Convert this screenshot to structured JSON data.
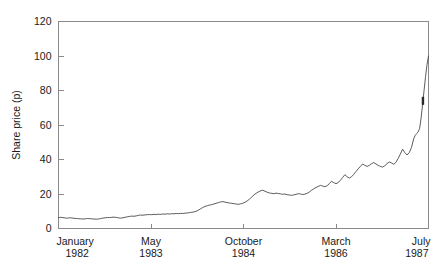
{
  "chart_data": {
    "type": "line",
    "title": "",
    "xlabel": "",
    "ylabel": "Share price (p)",
    "ylim": [
      0,
      120
    ],
    "yticks": [
      0,
      20,
      40,
      60,
      80,
      100,
      120
    ],
    "ytick_labels": [
      "0",
      "20",
      "40",
      "60",
      "80",
      "100",
      "120"
    ],
    "grid": false,
    "legend": false,
    "xtick_labels": [
      {
        "month": "January",
        "year": "1982"
      },
      {
        "month": "May",
        "year": "1983"
      },
      {
        "month": "October",
        "year": "1984"
      },
      {
        "month": "March",
        "year": "1986"
      },
      {
        "month": "July",
        "year": "1987"
      }
    ],
    "xtick_positions": [
      0.0,
      0.25,
      0.5,
      0.75,
      1.0
    ],
    "series": [
      {
        "name": "Share price",
        "x": [
          0.0,
          0.006,
          0.012,
          0.018,
          0.024,
          0.03,
          0.036,
          0.042,
          0.048,
          0.054,
          0.06,
          0.066,
          0.072,
          0.078,
          0.084,
          0.09,
          0.096,
          0.102,
          0.108,
          0.114,
          0.12,
          0.126,
          0.132,
          0.138,
          0.144,
          0.15,
          0.156,
          0.162,
          0.168,
          0.174,
          0.18,
          0.186,
          0.192,
          0.198,
          0.204,
          0.21,
          0.216,
          0.222,
          0.228,
          0.234,
          0.24,
          0.246,
          0.252,
          0.258,
          0.264,
          0.27,
          0.276,
          0.282,
          0.288,
          0.294,
          0.3,
          0.306,
          0.312,
          0.318,
          0.324,
          0.33,
          0.336,
          0.342,
          0.348,
          0.354,
          0.36,
          0.366,
          0.372,
          0.378,
          0.384,
          0.39,
          0.396,
          0.402,
          0.408,
          0.414,
          0.42,
          0.426,
          0.432,
          0.438,
          0.444,
          0.45,
          0.456,
          0.462,
          0.468,
          0.474,
          0.48,
          0.486,
          0.492,
          0.498,
          0.504,
          0.51,
          0.516,
          0.522,
          0.528,
          0.534,
          0.54,
          0.546,
          0.552,
          0.558,
          0.564,
          0.57,
          0.576,
          0.582,
          0.588,
          0.594,
          0.6,
          0.606,
          0.612,
          0.618,
          0.624,
          0.63,
          0.636,
          0.642,
          0.648,
          0.654,
          0.66,
          0.666,
          0.672,
          0.678,
          0.684,
          0.69,
          0.696,
          0.702,
          0.708,
          0.714,
          0.72,
          0.726,
          0.732,
          0.738,
          0.744,
          0.75,
          0.756,
          0.762,
          0.768,
          0.774,
          0.78,
          0.786,
          0.792,
          0.798,
          0.804,
          0.81,
          0.816,
          0.822,
          0.828,
          0.834,
          0.84,
          0.846,
          0.852,
          0.858,
          0.864,
          0.87,
          0.876,
          0.882,
          0.888,
          0.894,
          0.9,
          0.906,
          0.912,
          0.918,
          0.924,
          0.93,
          0.936,
          0.942,
          0.948,
          0.954,
          0.96,
          0.964,
          0.968,
          0.972,
          0.976,
          0.98,
          0.984,
          0.988,
          0.992,
          0.996,
          1.0
        ],
        "values": [
          6.2,
          6.5,
          6.3,
          6.1,
          6.0,
          6.2,
          6.1,
          5.9,
          5.8,
          5.7,
          5.6,
          5.5,
          5.6,
          5.8,
          5.7,
          5.6,
          5.5,
          5.4,
          5.5,
          5.8,
          6.0,
          6.2,
          6.4,
          6.3,
          6.5,
          6.6,
          6.4,
          6.2,
          6.0,
          6.2,
          6.5,
          6.8,
          7.0,
          7.2,
          7.1,
          7.3,
          7.6,
          7.8,
          7.7,
          7.9,
          8.0,
          8.1,
          8.0,
          8.2,
          8.1,
          8.3,
          8.2,
          8.4,
          8.3,
          8.5,
          8.4,
          8.6,
          8.5,
          8.7,
          8.6,
          8.8,
          8.7,
          8.9,
          9.0,
          9.2,
          9.4,
          9.6,
          10.0,
          10.6,
          11.4,
          12.2,
          12.8,
          13.2,
          13.6,
          13.8,
          14.2,
          14.6,
          15.0,
          15.4,
          15.6,
          15.3,
          15.0,
          14.8,
          14.6,
          14.4,
          14.2,
          14.0,
          14.3,
          14.6,
          15.2,
          16.0,
          17.0,
          18.2,
          19.4,
          20.4,
          21.2,
          21.8,
          22.2,
          21.6,
          21.0,
          20.6,
          20.4,
          20.2,
          20.5,
          20.3,
          20.1,
          19.8,
          20.0,
          19.6,
          19.4,
          19.2,
          19.5,
          19.8,
          20.2,
          20.0,
          19.7,
          19.9,
          20.4,
          21.2,
          22.2,
          23.0,
          23.8,
          24.4,
          25.0,
          24.6,
          24.2,
          24.8,
          26.0,
          27.4,
          26.6,
          26.0,
          26.6,
          28.0,
          29.6,
          31.2,
          30.0,
          29.2,
          30.0,
          31.4,
          33.0,
          34.6,
          36.0,
          37.4,
          36.6,
          36.0,
          36.6,
          37.6,
          38.2,
          37.4,
          36.6,
          36.0,
          35.6,
          36.4,
          37.6,
          38.6,
          38.0,
          37.2,
          38.4,
          40.6,
          43.2,
          46.0,
          44.0,
          42.6,
          44.0,
          47.0,
          52.0,
          54.0,
          55.0,
          56.0,
          58.0,
          64.0,
          72.0,
          80.0,
          88.0,
          95.0,
          100.0
        ]
      }
    ],
    "annotations": [
      {
        "name": "spike-marker",
        "x": 0.985,
        "y": 74,
        "note": "dark mark on final spike"
      }
    ]
  },
  "axes": {
    "y_axis_title": "Share price (p)"
  }
}
